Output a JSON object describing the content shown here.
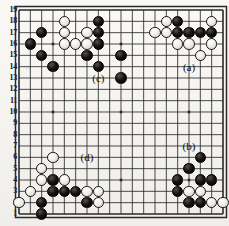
{
  "diagram": {
    "kind": "go-board-problem-diagram",
    "board_size": 19,
    "row_labels": [
      "19",
      "18",
      "17",
      "16",
      "15",
      "14",
      "13",
      "12",
      "11",
      "10",
      "9",
      "8",
      "7",
      "6",
      "5",
      "4",
      "3",
      "2",
      "1"
    ],
    "geometry": {
      "left": 19,
      "top": 10,
      "right": 223,
      "bottom": 214,
      "spacing": 11.333,
      "stone_diameter": 11.6,
      "star_points": [
        [
          4,
          4
        ],
        [
          10,
          4
        ],
        [
          16,
          4
        ],
        [
          4,
          10
        ],
        [
          10,
          10
        ],
        [
          16,
          10
        ],
        [
          4,
          16
        ],
        [
          10,
          16
        ],
        [
          16,
          16
        ]
      ]
    },
    "colors": {
      "black": "#000000",
      "white": "#ffffff",
      "line": "#2a2a2a",
      "paper": "#f4f2ee",
      "label_text": "#111111"
    },
    "labels": [
      {
        "text": "(a)",
        "col": 16,
        "row": 14
      },
      {
        "text": "(b)",
        "col": 16,
        "row": 7
      },
      {
        "text": "(c)",
        "col": 8,
        "row": 13
      },
      {
        "text": "(d)",
        "col": 7,
        "row": 6
      }
    ],
    "black_stones": [
      {
        "col": 3,
        "row": 17
      },
      {
        "col": 2,
        "row": 16
      },
      {
        "col": 3,
        "row": 15
      },
      {
        "col": 4,
        "row": 14
      },
      {
        "col": 8,
        "row": 18
      },
      {
        "col": 8,
        "row": 17
      },
      {
        "col": 8,
        "row": 16
      },
      {
        "col": 8,
        "row": 14
      },
      {
        "col": 7,
        "row": 15
      },
      {
        "col": 10,
        "row": 15
      },
      {
        "col": 10,
        "row": 13
      },
      {
        "col": 15,
        "row": 18
      },
      {
        "col": 15,
        "row": 17
      },
      {
        "col": 16,
        "row": 17
      },
      {
        "col": 17,
        "row": 17
      },
      {
        "col": 18,
        "row": 17
      },
      {
        "col": 4,
        "row": 4
      },
      {
        "col": 4,
        "row": 3
      },
      {
        "col": 5,
        "row": 3
      },
      {
        "col": 6,
        "row": 3
      },
      {
        "col": 3,
        "row": 2
      },
      {
        "col": 3,
        "row": 1
      },
      {
        "col": 7,
        "row": 2
      },
      {
        "col": 17,
        "row": 6
      },
      {
        "col": 16,
        "row": 5
      },
      {
        "col": 15,
        "row": 4
      },
      {
        "col": 15,
        "row": 3
      },
      {
        "col": 17,
        "row": 4
      },
      {
        "col": 18,
        "row": 4
      },
      {
        "col": 16,
        "row": 2
      },
      {
        "col": 17,
        "row": 2
      }
    ],
    "white_stones": [
      {
        "col": 5,
        "row": 18
      },
      {
        "col": 5,
        "row": 17
      },
      {
        "col": 7,
        "row": 17
      },
      {
        "col": 5,
        "row": 16
      },
      {
        "col": 6,
        "row": 16
      },
      {
        "col": 7,
        "row": 16
      },
      {
        "col": 14,
        "row": 18
      },
      {
        "col": 18,
        "row": 18
      },
      {
        "col": 13,
        "row": 17
      },
      {
        "col": 14,
        "row": 17
      },
      {
        "col": 15,
        "row": 16
      },
      {
        "col": 16,
        "row": 16
      },
      {
        "col": 18,
        "row": 16
      },
      {
        "col": 17,
        "row": 15
      },
      {
        "col": 4,
        "row": 6
      },
      {
        "col": 3,
        "row": 5
      },
      {
        "col": 3,
        "row": 4
      },
      {
        "col": 5,
        "row": 4
      },
      {
        "col": 2,
        "row": 3
      },
      {
        "col": 7,
        "row": 3
      },
      {
        "col": 8,
        "row": 3
      },
      {
        "col": 8,
        "row": 2
      },
      {
        "col": 1,
        "row": 2
      },
      {
        "col": 16,
        "row": 3
      },
      {
        "col": 17,
        "row": 3
      },
      {
        "col": 18,
        "row": 2
      },
      {
        "col": 19,
        "row": 2
      }
    ]
  }
}
